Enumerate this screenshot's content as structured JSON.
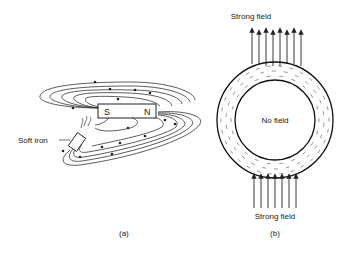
{
  "figure_a": {
    "magnet_south": "S",
    "magnet_north": "N",
    "soft_iron_label": "Soft iron",
    "caption": "(a)"
  },
  "figure_b": {
    "top_label": "Strong field",
    "bottom_label": "Strong field",
    "center_label": "No field",
    "caption": "(b)"
  }
}
